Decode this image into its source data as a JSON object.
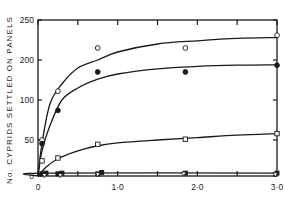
{
  "chart_data": {
    "type": "scatter",
    "title": "",
    "xlabel": "",
    "ylabel": "No. CYPRIDS SETTLED ON PANELS",
    "xlim": [
      0,
      3.0
    ],
    "ylim": [
      0,
      250
    ],
    "x_ticks": [
      0,
      0.5,
      1.0,
      1.5,
      2.0,
      2.5,
      3.0
    ],
    "x_tick_labels": [
      {
        "value": 0,
        "label": "0"
      },
      {
        "value": 1.0,
        "label": "1·0"
      },
      {
        "value": 2.0,
        "label": "2·0"
      },
      {
        "value": 3.0,
        "label": "3·0"
      }
    ],
    "y_tick_labels": [
      {
        "value": 0,
        "label": "0"
      },
      {
        "value": 50,
        "label": "50"
      },
      {
        "value": 100,
        "label": "100"
      },
      {
        "value": 200,
        "label": "200"
      },
      {
        "value": 250,
        "label": "250"
      }
    ],
    "grid": false,
    "legend": "none",
    "series": [
      {
        "name": "open circles",
        "marker": "open-circle",
        "fit_curve": true,
        "points": [
          [
            0.05,
            50
          ],
          [
            0.25,
            122
          ],
          [
            0.75,
            215
          ],
          [
            1.85,
            215
          ],
          [
            3.0,
            231
          ]
        ],
        "curve": [
          [
            0.0,
            0
          ],
          [
            0.05,
            45
          ],
          [
            0.15,
            95
          ],
          [
            0.3,
            140
          ],
          [
            0.5,
            180
          ],
          [
            0.75,
            200
          ],
          [
            1.0,
            210
          ],
          [
            1.5,
            220
          ],
          [
            2.0,
            224
          ],
          [
            2.5,
            227
          ],
          [
            3.0,
            228
          ]
        ]
      },
      {
        "name": "filled circles",
        "marker": "filled-circle",
        "fit_curve": true,
        "points": [
          [
            0.05,
            45
          ],
          [
            0.25,
            87
          ],
          [
            0.75,
            170
          ],
          [
            1.85,
            170
          ],
          [
            3.0,
            187
          ]
        ],
        "curve": [
          [
            0.0,
            0
          ],
          [
            0.05,
            35
          ],
          [
            0.15,
            68
          ],
          [
            0.3,
            100
          ],
          [
            0.5,
            130
          ],
          [
            0.75,
            152
          ],
          [
            1.0,
            165
          ],
          [
            1.5,
            178
          ],
          [
            2.0,
            184
          ],
          [
            2.5,
            187
          ],
          [
            3.0,
            188
          ]
        ]
      },
      {
        "name": "open squares",
        "marker": "open-square",
        "fit_curve": true,
        "points": [
          [
            0.05,
            21
          ],
          [
            0.25,
            25
          ],
          [
            0.75,
            44
          ],
          [
            1.85,
            51
          ],
          [
            3.0,
            58
          ]
        ],
        "curve": [
          [
            0.0,
            0
          ],
          [
            0.1,
            12
          ],
          [
            0.25,
            24
          ],
          [
            0.5,
            35
          ],
          [
            0.75,
            42
          ],
          [
            1.0,
            46
          ],
          [
            1.5,
            50
          ],
          [
            2.0,
            53
          ],
          [
            2.5,
            56
          ],
          [
            3.0,
            58
          ]
        ]
      },
      {
        "name": "filled squares",
        "marker": "filled-square",
        "fit_curve": true,
        "points": [
          [
            0.05,
            3
          ],
          [
            0.1,
            4
          ],
          [
            0.25,
            3
          ],
          [
            0.3,
            4
          ],
          [
            0.75,
            3
          ],
          [
            0.8,
            5
          ],
          [
            1.85,
            4
          ],
          [
            3.0,
            4
          ]
        ],
        "curve": [
          [
            0.0,
            0
          ],
          [
            0.05,
            4
          ],
          [
            3.0,
            4
          ]
        ]
      },
      {
        "name": "open triangles",
        "marker": "open-triangle",
        "fit_curve": false,
        "points": [
          [
            0.08,
            1
          ],
          [
            0.28,
            1
          ],
          [
            0.75,
            2
          ],
          [
            1.83,
            3
          ],
          [
            2.98,
            2
          ]
        ]
      }
    ]
  }
}
